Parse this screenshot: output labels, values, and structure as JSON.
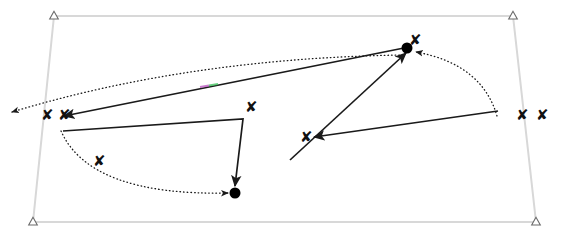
{
  "scene": {
    "title": "robot-trajectory-diagram",
    "width": 570,
    "height": 238,
    "background_color": "#ffffff"
  },
  "colors": {
    "frame": "#d8d8d8",
    "frame_corner_marker": "#6a6a6a",
    "solid_path": "#1a1a1a",
    "dotted_path": "#1a1a1a",
    "waypoint_marker": "#111111",
    "endpoint_dot": "#000000",
    "highlight_green": "#44c462",
    "highlight_magenta": "#b84fbf"
  },
  "frame": {
    "name": "workspace-boundary",
    "corners": [
      {
        "label": "top-left",
        "x": 54,
        "y": 16
      },
      {
        "label": "top-right",
        "x": 513,
        "y": 16
      },
      {
        "label": "bottom-right",
        "x": 536,
        "y": 222
      },
      {
        "label": "bottom-left",
        "x": 33,
        "y": 222
      }
    ],
    "corner_marker_shape": "triangle",
    "stroke_width": 2
  },
  "waypoints": [
    {
      "id": "wp-1",
      "x": 46,
      "y": 116,
      "size": 15
    },
    {
      "id": "wp-2",
      "x": 63,
      "y": 116,
      "size": 15
    },
    {
      "id": "wp-3",
      "x": 250,
      "y": 108,
      "size": 15
    },
    {
      "id": "wp-4",
      "x": 98,
      "y": 162,
      "size": 15
    },
    {
      "id": "wp-5",
      "x": 305,
      "y": 138,
      "size": 15
    },
    {
      "id": "wp-6",
      "x": 414,
      "y": 41,
      "size": 15
    },
    {
      "id": "wp-7",
      "x": 521,
      "y": 116,
      "size": 15
    },
    {
      "id": "wp-8",
      "x": 541,
      "y": 116,
      "size": 15
    }
  ],
  "endpoints": [
    {
      "id": "endpoint-top-right",
      "x": 407,
      "y": 48,
      "radius": 5.5
    },
    {
      "id": "endpoint-bottom-left",
      "x": 235,
      "y": 193,
      "radius": 5.5
    }
  ],
  "solid_paths": [
    {
      "id": "path-main-diagonal",
      "from": {
        "x": 404,
        "y": 48
      },
      "to": {
        "x": 64,
        "y": 116
      },
      "arrow_at": "to",
      "highlight_segment": {
        "x1": 200,
        "y1": 87,
        "x2": 218,
        "y2": 84
      }
    },
    {
      "id": "path-lower-left-hook",
      "points": [
        {
          "x": 63,
          "y": 131
        },
        {
          "x": 243,
          "y": 119
        },
        {
          "x": 235,
          "y": 186
        }
      ],
      "arrow_at": "to"
    },
    {
      "id": "path-lower-right-approach",
      "from": {
        "x": 290,
        "y": 160
      },
      "to": {
        "x": 406,
        "y": 53
      },
      "arrow_at": "to"
    },
    {
      "id": "path-right-to-left-marker",
      "from": {
        "x": 498,
        "y": 111
      },
      "to": {
        "x": 314,
        "y": 137
      },
      "arrow_at": "to"
    }
  ],
  "dotted_paths": [
    {
      "id": "dotted-long-arc-to-left",
      "start": {
        "x": 403,
        "y": 55
      },
      "control": {
        "x": 190,
        "y": 58
      },
      "end": {
        "x": 12,
        "y": 112
      },
      "arrow_at": "end"
    },
    {
      "id": "dotted-right-descending-arc",
      "start": {
        "x": 497,
        "y": 116
      },
      "control": {
        "x": 482,
        "y": 64
      },
      "end": {
        "x": 416,
        "y": 52
      },
      "arrow_at": "end"
    },
    {
      "id": "dotted-bottom-left-arc",
      "start": {
        "x": 61,
        "y": 131
      },
      "control": {
        "x": 90,
        "y": 196
      },
      "end": {
        "x": 228,
        "y": 193
      },
      "arrow_at": "end"
    }
  ],
  "legend": {
    "solid_meaning": "executed-trajectory",
    "dotted_meaning": "planned-trajectory",
    "x_meaning": "waypoint",
    "dot_meaning": "goal-position",
    "triangle_meaning": "boundary-corner"
  }
}
